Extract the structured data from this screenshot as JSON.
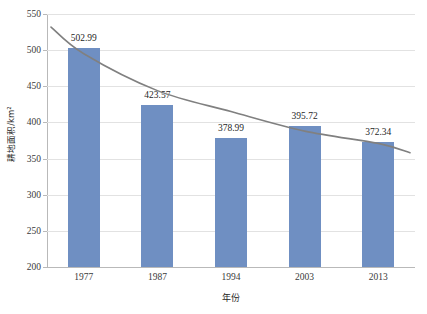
{
  "chart_data": {
    "type": "bar",
    "title": "",
    "xlabel": "年份",
    "ylabel": "耕地面积/km²",
    "categories": [
      "1977",
      "1987",
      "1994",
      "2003",
      "2013"
    ],
    "values": [
      502.99,
      423.57,
      378.99,
      395.72,
      372.34
    ],
    "value_labels": [
      "502.99",
      "423.57",
      "378.99",
      "395.72",
      "372.34"
    ],
    "ylim": [
      200,
      550
    ],
    "yticks": [
      200,
      250,
      300,
      350,
      400,
      450,
      500,
      550
    ],
    "ytick_labels": [
      "200",
      "250",
      "300",
      "350",
      "400",
      "450",
      "500",
      "550"
    ],
    "grid": true,
    "legend": "none",
    "series": [
      {
        "name": "耕地面积",
        "type": "bar",
        "color": "#6f8fc2",
        "values": [
          502.99,
          423.57,
          378.99,
          395.72,
          372.34
        ]
      },
      {
        "name": "趋势线",
        "type": "trendline",
        "color": "#808080",
        "style": "smooth-decreasing"
      }
    ]
  },
  "colors": {
    "bar": "#6f8fc2",
    "trendline": "#808080",
    "gridline": "#e2e2e2",
    "axis": "#b9b9b9",
    "text": "#2b2b2b",
    "background": "#ffffff"
  }
}
